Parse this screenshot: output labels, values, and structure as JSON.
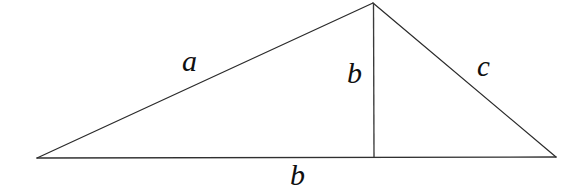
{
  "figure": {
    "name": "triangle-with-altitude",
    "background_color": "#ffffff",
    "line_color": "#2b2b2b",
    "label_color": "#101010",
    "width": 574,
    "height": 196
  },
  "geometry": {
    "vertices": {
      "left": {
        "x": 37,
        "y": 158
      },
      "apex": {
        "x": 373,
        "y": 3
      },
      "right": {
        "x": 556,
        "y": 157
      }
    },
    "altitude_foot": {
      "x": 374,
      "y": 157
    },
    "edges": [
      {
        "name": "left-side",
        "from": "left",
        "to": "apex",
        "label": "a"
      },
      {
        "name": "right-side",
        "from": "apex",
        "to": "right",
        "label": "c"
      },
      {
        "name": "base",
        "from": "left",
        "to": "right",
        "label": "b"
      },
      {
        "name": "altitude",
        "from": "apex",
        "to": "altitude_foot",
        "label": "b"
      }
    ]
  },
  "labels": {
    "side_a": "a",
    "altitude_b": "b",
    "side_c": "c",
    "base_b": "b"
  }
}
